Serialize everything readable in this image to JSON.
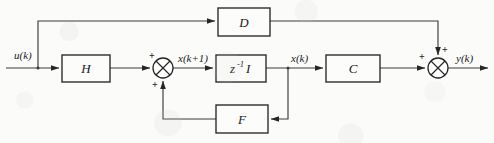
{
  "diagram": {
    "background_color": "#fbfbfa",
    "line_color": "#3b3b3b",
    "box_stroke_color": "#262626",
    "blocks": [
      {
        "id": "D",
        "label": "D",
        "x": 218,
        "y": 8,
        "w": 52,
        "h": 28
      },
      {
        "id": "H",
        "label": "H",
        "x": 62,
        "y": 55,
        "w": 48,
        "h": 27
      },
      {
        "id": "Z",
        "label": "z",
        "sup": "-1",
        "post": "I",
        "x": 216,
        "y": 55,
        "w": 50,
        "h": 27
      },
      {
        "id": "C",
        "label": "C",
        "x": 326,
        "y": 55,
        "w": 54,
        "h": 27
      },
      {
        "id": "F",
        "label": "F",
        "x": 216,
        "y": 105,
        "w": 52,
        "h": 28
      }
    ],
    "summers": [
      {
        "id": "sum1",
        "cx": 163,
        "cy": 68,
        "r": 10,
        "signs": [
          {
            "text": "+",
            "x": 149,
            "y": 55
          },
          {
            "text": "+",
            "x": 152,
            "y": 86
          }
        ]
      },
      {
        "id": "sum2",
        "cx": 438,
        "cy": 68,
        "r": 10,
        "signs": [
          {
            "text": "+",
            "x": 418,
            "y": 56
          },
          {
            "text": "+",
            "x": 442,
            "y": 50
          }
        ]
      }
    ],
    "signal_labels": [
      {
        "id": "u",
        "text": "u(k)",
        "x": 14,
        "y": 55
      },
      {
        "id": "xk1",
        "text": "x(k+1)",
        "x": 178,
        "y": 60
      },
      {
        "id": "xk",
        "text": "x(k)",
        "x": 292,
        "y": 60
      },
      {
        "id": "y",
        "text": "y(k)",
        "x": 457,
        "y": 60
      }
    ],
    "wires": [
      {
        "id": "u-in",
        "desc": "input u(k) into H"
      },
      {
        "id": "u-branch-up",
        "desc": "u(k) branch up to D"
      },
      {
        "id": "u-to-D",
        "desc": "top feedforward into D"
      },
      {
        "id": "D-to-sum2",
        "desc": "D output right then down into output summer"
      },
      {
        "id": "H-to-sum1",
        "desc": "H output into first summer"
      },
      {
        "id": "sum1-to-z",
        "desc": "x(k+1) into unit delay"
      },
      {
        "id": "z-to-C",
        "desc": "x(k) into C"
      },
      {
        "id": "x-branch-dn",
        "desc": "x(k) branch down to F"
      },
      {
        "id": "F-fb",
        "desc": "F output feedback up to first summer"
      },
      {
        "id": "C-to-sum2",
        "desc": "C output into output summer"
      },
      {
        "id": "y-out",
        "desc": "y(k) output arrow"
      }
    ]
  }
}
